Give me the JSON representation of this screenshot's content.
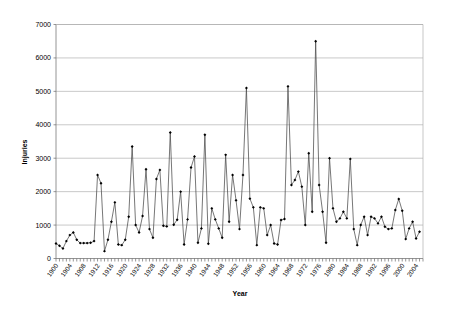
{
  "chart_data": {
    "type": "line",
    "title": "",
    "xlabel": "Year",
    "ylabel": "Injuries",
    "ylim": [
      0,
      7000
    ],
    "xlim": [
      1900,
      2006
    ],
    "ytick_step": 1000,
    "yticks": [
      0,
      1000,
      2000,
      3000,
      4000,
      5000,
      6000,
      7000
    ],
    "xticks": [
      1900,
      1904,
      1908,
      1912,
      1916,
      1920,
      1924,
      1928,
      1932,
      1936,
      1940,
      1944,
      1948,
      1952,
      1956,
      1960,
      1964,
      1968,
      1972,
      1976,
      1980,
      1984,
      1988,
      1992,
      1996,
      2000,
      2004
    ],
    "xtick_labels": [
      "1900",
      "1904",
      "1908",
      "1912",
      "1916",
      "1920",
      "1924",
      "1928",
      "1932",
      "1936",
      "1940",
      "1944",
      "1948",
      "1952",
      "1956",
      "1960",
      "1964",
      "1968",
      "1972",
      "1976",
      "1980",
      "1984",
      "1988",
      "1992",
      "1996",
      "2000",
      "2004"
    ],
    "ytick_labels": [
      "0",
      "1000",
      "2000",
      "3000",
      "4000",
      "5000",
      "6000",
      "7000"
    ],
    "grid": true,
    "grid_axis": "y",
    "legend": false,
    "legend_position": "none",
    "marker": "diamond",
    "line_color": "#4a4a4a",
    "marker_color": "#000000",
    "grid_color": "#b0b0b0",
    "x": [
      1900,
      1901,
      1902,
      1903,
      1904,
      1905,
      1906,
      1907,
      1908,
      1909,
      1910,
      1911,
      1912,
      1913,
      1914,
      1915,
      1916,
      1917,
      1918,
      1919,
      1920,
      1921,
      1922,
      1923,
      1924,
      1925,
      1926,
      1927,
      1928,
      1929,
      1930,
      1931,
      1932,
      1933,
      1934,
      1935,
      1936,
      1937,
      1938,
      1939,
      1940,
      1941,
      1942,
      1943,
      1944,
      1945,
      1946,
      1947,
      1948,
      1949,
      1950,
      1951,
      1952,
      1953,
      1954,
      1955,
      1956,
      1957,
      1958,
      1959,
      1960,
      1961,
      1962,
      1963,
      1964,
      1965,
      1966,
      1967,
      1968,
      1969,
      1970,
      1971,
      1972,
      1973,
      1974,
      1975,
      1976,
      1977,
      1978,
      1979,
      1980,
      1981,
      1982,
      1983,
      1984,
      1985,
      1986,
      1987,
      1988,
      1989,
      1990,
      1991,
      1992,
      1993,
      1994,
      1995,
      1996,
      1997,
      1998,
      1999,
      2000,
      2001,
      2002,
      2003,
      2004,
      2005,
      2006
    ],
    "y": [
      450,
      380,
      300,
      520,
      700,
      780,
      560,
      460,
      460,
      460,
      470,
      520,
      2500,
      2250,
      220,
      560,
      1100,
      1680,
      420,
      400,
      560,
      1250,
      3350,
      1000,
      780,
      1270,
      2670,
      880,
      620,
      2380,
      2650,
      980,
      960,
      3770,
      1010,
      1160,
      2000,
      420,
      1170,
      2720,
      3050,
      470,
      900,
      3700,
      440,
      1500,
      1170,
      900,
      620,
      3100,
      1100,
      2500,
      1740,
      880,
      2500,
      5100,
      1790,
      1530,
      400,
      1530,
      1500,
      700,
      1000,
      450,
      420,
      1150,
      1180,
      5150,
      2200,
      2350,
      2600,
      2150,
      1000,
      3150,
      1400,
      6500,
      2200,
      1400,
      470,
      3000,
      1500,
      1100,
      1200,
      1400,
      1200,
      2980,
      880,
      400,
      1000,
      1250,
      700,
      1250,
      1200,
      1050,
      1250,
      950,
      880,
      900,
      1450,
      1780,
      1430,
      580,
      900,
      1100,
      600,
      800
    ]
  },
  "labels": {
    "x_axis_title": "Year",
    "y_axis_title": "Injuries"
  }
}
